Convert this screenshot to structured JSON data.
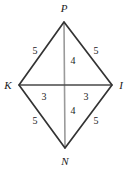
{
  "figure": {
    "background_color": "#ffffff",
    "edge_color": "#333333",
    "diagonal_horizontal_color": "#4a4a4a",
    "diagonal_vertical_color": "#9a9a9a",
    "text_color": "#1b1b1b",
    "vertices": [
      {
        "name": "P",
        "label": "P",
        "x": 64,
        "y": 22,
        "label_x": 64,
        "label_y": 8
      },
      {
        "name": "K",
        "label": "K",
        "x": 19,
        "y": 85,
        "label_x": 8,
        "label_y": 85
      },
      {
        "name": "I",
        "label": "I",
        "x": 112,
        "y": 85,
        "label_x": 121,
        "label_y": 85
      },
      {
        "name": "N",
        "label": "N",
        "x": 65,
        "y": 148,
        "label_x": 65,
        "label_y": 161
      }
    ],
    "edges": [
      {
        "name": "side-PK",
        "from": "P",
        "to": "K",
        "label": "5",
        "label_x": 35,
        "label_y": 51
      },
      {
        "name": "side-PI",
        "from": "P",
        "to": "I",
        "label": "5",
        "label_x": 96,
        "label_y": 51
      },
      {
        "name": "side-KN",
        "from": "K",
        "to": "N",
        "label": "5",
        "label_x": 35,
        "label_y": 121
      },
      {
        "name": "side-NI",
        "from": "N",
        "to": "I",
        "label": "5",
        "label_x": 96,
        "label_y": 121
      }
    ],
    "diagonal_segments": [
      {
        "name": "segment-P-center",
        "label": "4",
        "label_x": 73,
        "label_y": 61
      },
      {
        "name": "segment-center-N",
        "label": "4",
        "label_x": 73,
        "label_y": 111
      },
      {
        "name": "segment-K-center",
        "label": "3",
        "label_x": 44,
        "label_y": 97
      },
      {
        "name": "segment-center-I",
        "label": "3",
        "label_x": 86,
        "label_y": 97
      }
    ]
  }
}
